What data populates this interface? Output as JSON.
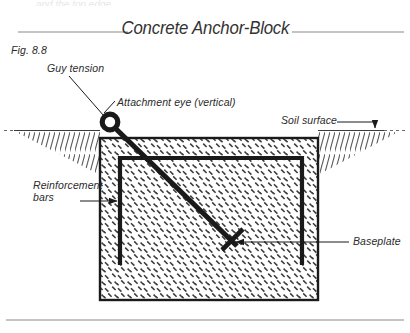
{
  "figure": {
    "title": "Concrete Anchor-Block",
    "number": "Fig. 8.8",
    "top_cut_text": "and the top edge",
    "labels": {
      "guy_tension": "Guy tension",
      "attachment_eye": "Attachment eye (vertical)",
      "soil_surface": "Soil surface",
      "reinforcement_bars_line1": "Reinforcement",
      "reinforcement_bars_line2": "bars",
      "baseplate": "Baseplate"
    },
    "colors": {
      "ink": "#1a1a1a",
      "label_text": "#2b2b2b",
      "title_text": "#333333",
      "rule": "#8a8a8a",
      "hatch": "#3a3a3a",
      "block_fill": "#ffffff",
      "background": "#ffffff"
    },
    "geometry": {
      "block": {
        "x": 100,
        "y": 138,
        "width": 218,
        "height": 162
      },
      "rebar_cage": {
        "x": 120,
        "y": 158,
        "width": 182,
        "height": 107,
        "open_side": "bottom"
      },
      "soil_line_y": 130,
      "attachment_eye": {
        "cx": 110,
        "cy": 122,
        "r_outer": 8,
        "r_inner": 3.6
      },
      "tendon": {
        "x1": 115,
        "y1": 128,
        "x2": 237,
        "y2": 246
      },
      "baseplate_center": {
        "x": 233,
        "y": 242
      },
      "title_rule_y": 32,
      "bottom_rule_y": 320
    }
  }
}
